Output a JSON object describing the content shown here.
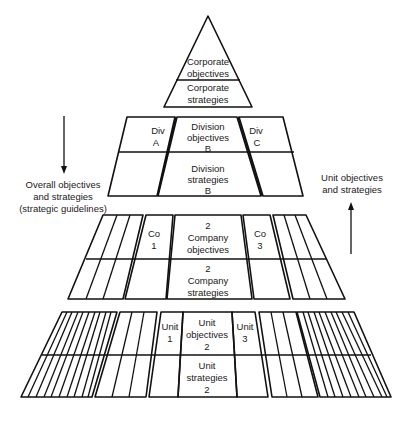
{
  "diagram": {
    "type": "hierarchy-pyramid",
    "tiers": [
      {
        "level": "corporate",
        "cells": [
          {
            "lines": [
              "Corporate",
              "objectives"
            ]
          },
          {
            "lines": [
              "Corporate",
              "strategies"
            ]
          }
        ]
      },
      {
        "level": "division",
        "side_left": {
          "lines": [
            "Div",
            "A"
          ]
        },
        "center_top": {
          "lines": [
            "Division",
            "objectives",
            "B"
          ]
        },
        "center_bottom": {
          "lines": [
            "Division",
            "strategies",
            "B"
          ]
        },
        "side_right": {
          "lines": [
            "Div",
            "C"
          ]
        }
      },
      {
        "level": "company",
        "side_left": {
          "lines": [
            "Co",
            "1"
          ]
        },
        "center_top": {
          "lines": [
            "2",
            "Company",
            "objectives"
          ]
        },
        "center_bottom": {
          "lines": [
            "2",
            "Company",
            "strategies"
          ]
        },
        "side_right": {
          "lines": [
            "Co",
            "3"
          ]
        }
      },
      {
        "level": "unit",
        "side_left": {
          "lines": [
            "Unit",
            "1"
          ]
        },
        "center_top": {
          "lines": [
            "Unit",
            "objectives",
            "2"
          ]
        },
        "center_bottom": {
          "lines": [
            "Unit",
            "strategies",
            "2"
          ]
        },
        "side_right": {
          "lines": [
            "Unit",
            "3"
          ]
        }
      }
    ],
    "left_annotation": {
      "arrow_direction": "down",
      "lines": [
        "Overall objectives",
        "and strategies",
        "(strategic guidelines)"
      ]
    },
    "right_annotation": {
      "arrow_direction": "up",
      "lines": [
        "Unit objectives",
        "and strategies"
      ]
    },
    "colors": {
      "line": "#111111",
      "text": "#1a1a1a",
      "background": "#ffffff"
    }
  }
}
